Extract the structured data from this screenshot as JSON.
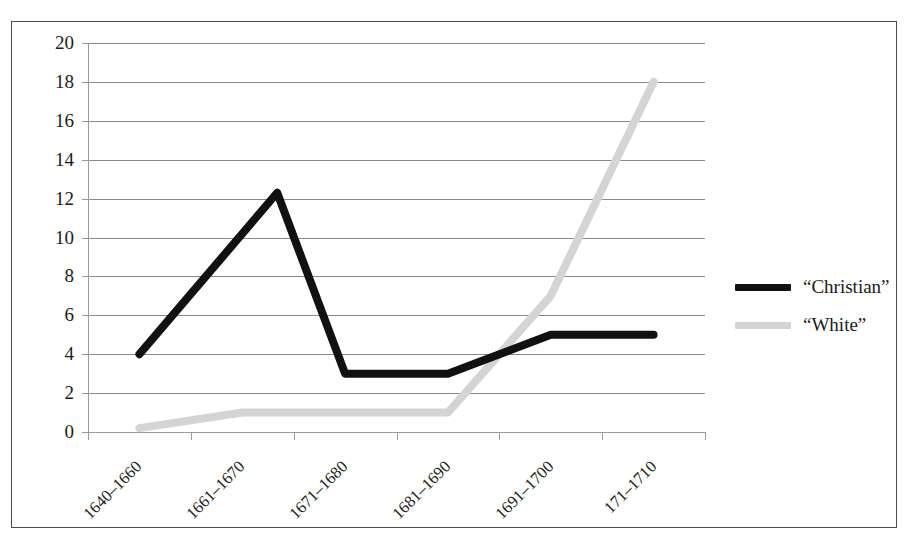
{
  "chart_data": {
    "type": "line",
    "title": "",
    "subtitle": "",
    "xlabel": "",
    "ylabel": "",
    "categories": [
      "1640–1660",
      "1661–1670",
      "1671–1680",
      "1681–1690",
      "1691–1700",
      "171–1710"
    ],
    "series": [
      {
        "name": "“Christian”",
        "color": "#111111",
        "values": [
          4,
          3,
          3,
          3,
          5,
          5
        ],
        "peak_between_1_and_2": 12.3
      },
      {
        "name": "“White”",
        "color": "#d4d4d4",
        "values": [
          0.2,
          1,
          1,
          1,
          7,
          18
        ]
      }
    ],
    "ylim": [
      0,
      20
    ],
    "ytick_step": 2,
    "yticks": [
      "0",
      "2",
      "4",
      "6",
      "8",
      "10",
      "12",
      "14",
      "16",
      "18",
      "20"
    ],
    "grid": true,
    "grid_axis": "y",
    "legend_position": "right",
    "legend": [
      "“Christian”",
      "“White”"
    ]
  },
  "axes": {
    "y_axis_name": "value-axis",
    "x_axis_name": "period-axis"
  },
  "legend_block": {
    "items": [
      {
        "label": "“Christian”",
        "color": "#111111",
        "swatch": "thick-black-line-swatch"
      },
      {
        "label": "“White”",
        "color": "#d4d4d4",
        "swatch": "thick-gray-line-swatch"
      }
    ]
  }
}
